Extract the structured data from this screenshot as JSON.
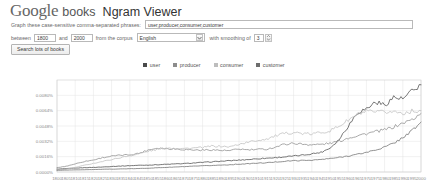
{
  "header": {
    "logo_google": "Google",
    "logo_books": "books",
    "title": "Ngram Viewer"
  },
  "form": {
    "phrases_label": "Graph these case-sensitive comma-separated phrases:",
    "phrases_value": "user,producer,consumer,customer",
    "between_label": "between",
    "year_start": "1800",
    "and_label": "and",
    "year_end": "2000",
    "corpus_label": "from the corpus",
    "corpus_value": "English",
    "smoothing_label": "with smoothing of",
    "smoothing_value": "3",
    "search_button": "Search lots of books"
  },
  "colors": {
    "user": "#4a4a4a",
    "producer": "#8c8c8c",
    "consumer": "#bdbdbd",
    "customer": "#6d6d6d",
    "grid": "#e2e2e2",
    "axis": "#cccccc",
    "tick_text": "#8a8a8a"
  },
  "chart_data": {
    "type": "line",
    "title": "",
    "xlabel": "",
    "ylabel": "",
    "grid": true,
    "legend_position": "top",
    "xlim": [
      1800,
      2000
    ],
    "ylim": [
      0,
      0.0096
    ],
    "yticks": [
      0.0,
      0.0016,
      0.0032,
      0.0048,
      0.0064,
      0.008
    ],
    "ytick_labels": [
      "0.0000%",
      "0.0016%",
      "0.0032%",
      "0.0048%",
      "0.0064%",
      "0.0080%"
    ],
    "xticks": [
      1800,
      1805,
      1810,
      1815,
      1820,
      1825,
      1830,
      1835,
      1840,
      1845,
      1850,
      1855,
      1860,
      1865,
      1870,
      1875,
      1880,
      1885,
      1890,
      1895,
      1900,
      1905,
      1910,
      1915,
      1920,
      1925,
      1930,
      1935,
      1940,
      1945,
      1950,
      1955,
      1960,
      1965,
      1970,
      1975,
      1980,
      1985,
      1990,
      1995,
      2000
    ],
    "xtick_labels": [
      "1800",
      "1805",
      "1810",
      "1815",
      "1820",
      "1825",
      "1830",
      "1835",
      "1840",
      "1845",
      "1850",
      "1855",
      "1860",
      "1865",
      "1870",
      "1875",
      "1880",
      "1885",
      "1890",
      "1895",
      "1900",
      "1905",
      "1910",
      "1915",
      "1920",
      "1925",
      "1930",
      "1935",
      "1940",
      "1945",
      "1950",
      "1955",
      "1960",
      "1965",
      "1970",
      "1975",
      "1980",
      "1985",
      "1990",
      "1995",
      "2000"
    ],
    "x": [
      1800,
      1805,
      1810,
      1815,
      1820,
      1825,
      1830,
      1835,
      1840,
      1845,
      1850,
      1855,
      1860,
      1865,
      1870,
      1875,
      1880,
      1885,
      1890,
      1895,
      1900,
      1905,
      1910,
      1915,
      1920,
      1925,
      1930,
      1935,
      1940,
      1945,
      1950,
      1955,
      1960,
      1965,
      1970,
      1975,
      1980,
      1985,
      1990,
      1995,
      2000
    ],
    "series": [
      {
        "name": "user",
        "color": "#4a4a4a",
        "values": [
          0.0003,
          0.00035,
          0.0004,
          0.00045,
          0.00048,
          0.00052,
          0.00058,
          0.00062,
          0.00066,
          0.0007,
          0.00072,
          0.00076,
          0.0008,
          0.00084,
          0.00088,
          0.00094,
          0.001,
          0.00106,
          0.00112,
          0.00118,
          0.00124,
          0.0013,
          0.00138,
          0.00144,
          0.0015,
          0.00158,
          0.00166,
          0.00176,
          0.0019,
          0.00205,
          0.0025,
          0.0034,
          0.0048,
          0.0062,
          0.0066,
          0.0073,
          0.007,
          0.0078,
          0.0076,
          0.0084,
          0.0091
        ]
      },
      {
        "name": "producer",
        "color": "#8c8c8c",
        "values": [
          0.00045,
          0.0006,
          0.00085,
          0.0011,
          0.00125,
          0.0015,
          0.00165,
          0.00175,
          0.0018,
          0.00195,
          0.0023,
          0.0025,
          0.00245,
          0.0024,
          0.00235,
          0.0023,
          0.00228,
          0.00232,
          0.00225,
          0.00222,
          0.0024,
          0.0023,
          0.00235,
          0.00238,
          0.0026,
          0.0029,
          0.003,
          0.0029,
          0.00285,
          0.00288,
          0.003,
          0.0032,
          0.00355,
          0.0038,
          0.004,
          0.0042,
          0.0044,
          0.0047,
          0.0051,
          0.00545,
          0.0061
        ]
      },
      {
        "name": "consumer",
        "color": "#bdbdbd",
        "values": [
          0.0002,
          0.0003,
          0.00048,
          0.0007,
          0.0009,
          0.0011,
          0.0013,
          0.0015,
          0.0017,
          0.0019,
          0.00215,
          0.00235,
          0.0025,
          0.0025,
          0.00245,
          0.0025,
          0.00255,
          0.0027,
          0.00268,
          0.00262,
          0.0029,
          0.0031,
          0.0033,
          0.00345,
          0.00375,
          0.004,
          0.00415,
          0.004,
          0.00395,
          0.00415,
          0.0043,
          0.0048,
          0.0054,
          0.006,
          0.0063,
          0.0062,
          0.00625,
          0.0063,
          0.00615,
          0.00635,
          0.0064
        ]
      },
      {
        "name": "customer",
        "color": "#6d6d6d",
        "values": [
          0.00018,
          0.0002,
          0.00022,
          0.00024,
          0.00026,
          0.00028,
          0.0003,
          0.00032,
          0.00034,
          0.00036,
          0.0004,
          0.00044,
          0.00048,
          0.00052,
          0.00056,
          0.0006,
          0.00064,
          0.00068,
          0.00072,
          0.00076,
          0.00082,
          0.00086,
          0.00092,
          0.00096,
          0.00104,
          0.00112,
          0.00118,
          0.0012,
          0.00124,
          0.0013,
          0.0014,
          0.00152,
          0.00168,
          0.00184,
          0.00205,
          0.0023,
          0.0026,
          0.003,
          0.0036,
          0.0043,
          0.0052
        ]
      }
    ]
  }
}
